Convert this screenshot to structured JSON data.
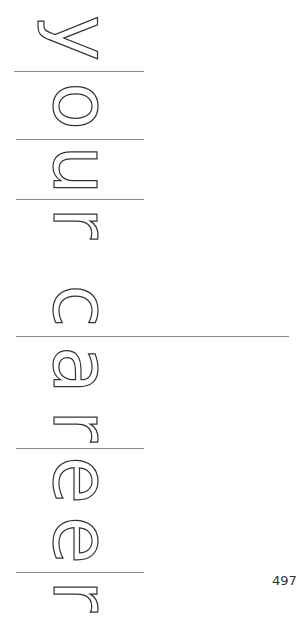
{
  "page": {
    "title_text": "your career",
    "letters": [
      {
        "char": "y"
      },
      {
        "char": "o"
      },
      {
        "char": "u"
      },
      {
        "char": "r"
      },
      {
        "char": "c"
      },
      {
        "char": "a"
      },
      {
        "char": "r"
      },
      {
        "char": "e"
      },
      {
        "char": "e"
      },
      {
        "char": "r"
      }
    ],
    "page_number": "497",
    "colors": {
      "outline": "#333333",
      "rule": "#8a8a8a",
      "background": "#ffffff"
    }
  }
}
